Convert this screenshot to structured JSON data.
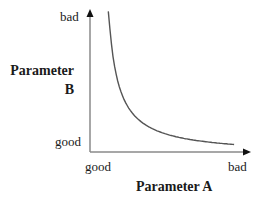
{
  "chart_data": {
    "type": "line",
    "title": "",
    "xlabel": "Parameter A",
    "ylabel": "Parameter B",
    "x_ticks": [
      "good",
      "bad"
    ],
    "y_ticks": [
      "good",
      "bad"
    ],
    "grid": false,
    "legend": null,
    "series": [
      {
        "name": "trade-off curve",
        "shape": "hyperbolic decay (inverse relationship)",
        "x": [
          0.12,
          0.15,
          0.2,
          0.3,
          0.4,
          0.5,
          0.6,
          0.7,
          0.8,
          0.9
        ],
        "y": [
          0.99,
          0.8,
          0.6,
          0.4,
          0.3,
          0.24,
          0.2,
          0.17,
          0.14,
          0.1
        ]
      }
    ],
    "xlim": [
      0,
      1
    ],
    "ylim": [
      0,
      1
    ]
  },
  "labels": {
    "y_bad": "bad",
    "y_good": "good",
    "x_good": "good",
    "x_bad": "bad",
    "y_title_line1": "Parameter",
    "y_title_line2": "B",
    "x_title": "Parameter A"
  },
  "colors": {
    "axis": "#8a8a8a",
    "curve": "#555555",
    "arrow": "#111111",
    "text": "#1a1a1a"
  }
}
